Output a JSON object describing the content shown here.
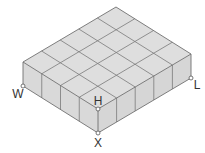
{
  "diagram": {
    "type": "isometric-rectangular-prism-of-unit-cubes",
    "grid": {
      "cubes_along_W_X": 4,
      "cubes_along_X_L": 5,
      "layers": 1
    },
    "colors": {
      "face": "#dedede",
      "line": "#707070",
      "background": "#ffffff"
    },
    "labels": {
      "W": "W",
      "L": "L",
      "H": "H",
      "X": "X"
    }
  }
}
